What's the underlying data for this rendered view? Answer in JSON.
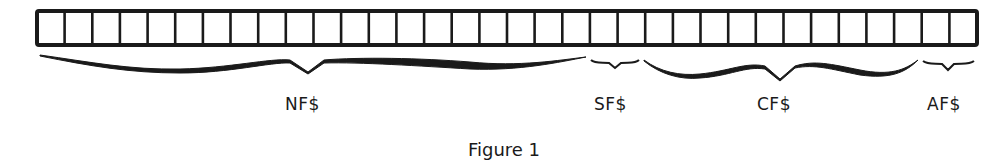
{
  "figure": {
    "caption": "Figure 1",
    "cell_count": 34,
    "colors": {
      "ink": "#1a1a1a",
      "background": "#ffffff"
    },
    "segments": [
      {
        "label": "NF$",
        "start_cell": 0,
        "cells": 20
      },
      {
        "label": "SF$",
        "start_cell": 20,
        "cells": 2
      },
      {
        "label": "CF$",
        "start_cell": 22,
        "cells": 10
      },
      {
        "label": "AF$",
        "start_cell": 32,
        "cells": 2
      }
    ]
  }
}
